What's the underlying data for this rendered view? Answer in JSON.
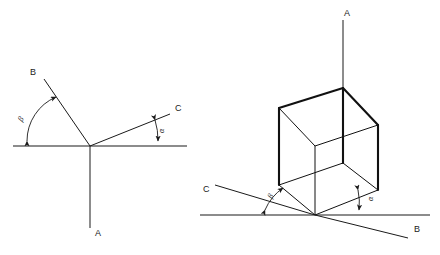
{
  "figure": {
    "background_color": "#ffffff",
    "line_color": "#1a1a1a",
    "width": 440,
    "height": 255
  },
  "diagrams": [
    {
      "id": "left",
      "name": "planar-axis-diagram",
      "description": "Three axes radiating from a common vertex on a horizontal reference line",
      "vertex": {
        "x": 90,
        "y": 146
      },
      "baseline": {
        "x1": 13,
        "y1": 146,
        "x2": 187,
        "y2": 146
      },
      "axes": [
        {
          "name": "axis-a",
          "label": "A",
          "label_x": 95,
          "label_y": 236,
          "x1": 90,
          "y1": 146,
          "x2": 90,
          "y2": 228
        },
        {
          "name": "axis-b",
          "label": "B",
          "label_x": 30,
          "label_y": 75,
          "x1": 90,
          "y1": 146,
          "x2": 44,
          "y2": 79
        },
        {
          "name": "axis-c",
          "label": "C",
          "label_x": 175,
          "label_y": 111,
          "x1": 90,
          "y1": 146,
          "x2": 170,
          "y2": 114
        }
      ],
      "angles": [
        {
          "name": "angle-beta",
          "label": "β",
          "label_x": 22,
          "label_y": 122,
          "rotation": -60,
          "between": [
            "baseline-left",
            "axis-b"
          ]
        },
        {
          "name": "angle-alpha",
          "label": "α",
          "label_x": 164,
          "label_y": 133,
          "rotation": -90,
          "between": [
            "axis-c",
            "baseline-right"
          ]
        }
      ]
    },
    {
      "id": "right",
      "name": "isometric-cube-axis-diagram",
      "description": "Isometric cube with three axes through a bottom corner on a horizontal reference line",
      "baseline": {
        "x1": 200,
        "y1": 215,
        "x2": 430,
        "y2": 215
      },
      "cube": {
        "name": "cube",
        "vertices": {
          "top_left": {
            "x": 279,
            "y": 108
          },
          "top_back": {
            "x": 343,
            "y": 88
          },
          "top_right": {
            "x": 378,
            "y": 125
          },
          "top_front": {
            "x": 315,
            "y": 146
          },
          "bottom_left": {
            "x": 279,
            "y": 185
          },
          "bottom_back": {
            "x": 343,
            "y": 163
          },
          "bottom_right": {
            "x": 378,
            "y": 190
          },
          "bottom_front": {
            "x": 315,
            "y": 215
          }
        }
      },
      "axes": [
        {
          "name": "axis-a",
          "label": "A",
          "label_x": 344,
          "label_y": 16,
          "x1": 343,
          "y1": 20,
          "x2": 343,
          "y2": 163
        },
        {
          "name": "axis-c",
          "label": "C",
          "label_x": 203,
          "label_y": 192,
          "x1": 315,
          "y1": 215,
          "x2": 215,
          "y2": 185
        },
        {
          "name": "axis-b",
          "label": "B",
          "label_x": 414,
          "label_y": 232,
          "x1": 315,
          "y1": 215,
          "x2": 408,
          "y2": 238
        }
      ],
      "angles": [
        {
          "name": "angle-beta",
          "label": "β",
          "label_x": 272,
          "label_y": 199,
          "rotation": -65,
          "between": [
            "baseline",
            "axis-c"
          ]
        },
        {
          "name": "angle-alpha",
          "label": "α",
          "label_x": 373,
          "label_y": 201,
          "rotation": -90,
          "between": [
            "axis-b",
            "baseline"
          ]
        }
      ]
    }
  ]
}
